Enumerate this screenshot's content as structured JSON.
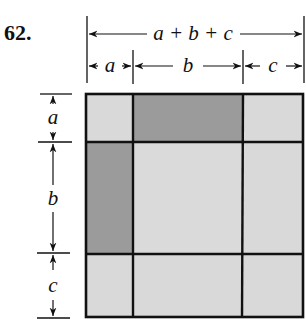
{
  "problem_number": "62.",
  "top_dimensions": {
    "total_label": "a + b + c",
    "segments": [
      "a",
      "b",
      "c"
    ]
  },
  "left_dimensions": {
    "segments": [
      "a",
      "b",
      "c"
    ]
  },
  "grid": {
    "rows": [
      "a",
      "b",
      "c"
    ],
    "cols": [
      "a",
      "b",
      "c"
    ],
    "cells": [
      [
        "light",
        "dark",
        "light"
      ],
      [
        "dark",
        "light",
        "light"
      ],
      [
        "light",
        "light",
        "light"
      ]
    ]
  },
  "colors": {
    "dark_fill": "#9b9b9b",
    "light_fill": "#d9d9d9",
    "line": "#111111"
  }
}
